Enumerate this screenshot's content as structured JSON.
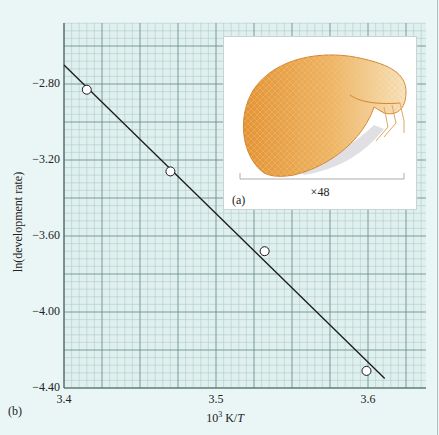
{
  "chart_data": {
    "type": "scatter",
    "title": "",
    "xlabel": "10³ K/T",
    "xlabel_base": "10",
    "xlabel_sup": "3",
    "xlabel_unit": " K/",
    "xlabel_var": "T",
    "ylabel": "ln(development rate)",
    "xlim": [
      3.4,
      3.638
    ],
    "ylim": [
      -4.4,
      -2.48
    ],
    "x_ticks": [
      3.4,
      3.5,
      3.6
    ],
    "x_tick_labels": [
      "3.4",
      "3.5",
      "3.6"
    ],
    "y_ticks": [
      -2.8,
      -3.2,
      -3.6,
      -4.0,
      -4.4
    ],
    "y_tick_labels": [
      "−2.80",
      "−3.20",
      "−3.60",
      "−4.00",
      "−4.40"
    ],
    "grid": true,
    "series": [
      {
        "name": "measured",
        "marker": "open-circle",
        "points": [
          {
            "x": 3.415,
            "y": -2.83
          },
          {
            "x": 3.47,
            "y": -3.26
          },
          {
            "x": 3.532,
            "y": -3.68
          },
          {
            "x": 3.599,
            "y": -4.31
          }
        ]
      },
      {
        "name": "linear fit",
        "type": "line",
        "points": [
          {
            "x": 3.4,
            "y": -2.7
          },
          {
            "x": 3.611,
            "y": -4.35
          }
        ]
      }
    ]
  },
  "panels": {
    "main_label": "(b)",
    "inset_label": "(a)",
    "inset_scale": "×48"
  },
  "colors": {
    "grid_bg": "#dff0ee",
    "grid_minor": "#a9c6c3",
    "grid_major": "#6f8f8c",
    "line": "#1a1a1a",
    "marker_fill": "#ffffff",
    "specimen": "#e8a24a"
  }
}
